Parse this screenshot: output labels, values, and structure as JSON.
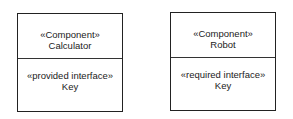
{
  "components": [
    {
      "stereotype": "«Component»",
      "name": "Calculator",
      "interface_stereotype": "«provided interface»",
      "interface_name": "Key"
    },
    {
      "stereotype": "«Component»",
      "name": "Robot",
      "interface_stereotype": "«required interface»",
      "interface_name": "Key"
    }
  ]
}
